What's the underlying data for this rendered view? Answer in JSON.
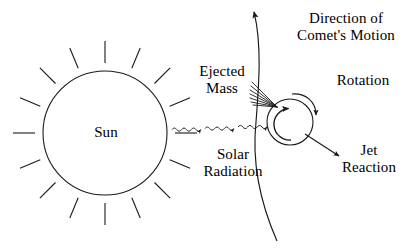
{
  "figure": {
    "background_color": "#ffffff",
    "stroke_color": "#1a1a1a",
    "text_color": "#000000",
    "width": 410,
    "height": 249
  },
  "labels": {
    "sun": "Sun",
    "ejected_mass": "Ejected\nMass",
    "solar_radiation": "Solar\nRadiation",
    "direction_of_motion": "Direction of\nComet's Motion",
    "rotation": "Rotation",
    "jet_reaction": "Jet\nReaction"
  },
  "diagram_data": {
    "type": "schematic-diagram",
    "sun": {
      "center_x": 105,
      "center_y": 133,
      "radius": 62,
      "ray_count": 16,
      "ray_inner_offset": 8,
      "ray_length": 22
    },
    "comet": {
      "center_x": 290,
      "center_y": 122,
      "radius": 23,
      "rotation_direction": "counter-clockwise-inner"
    },
    "orbit_path": {
      "description": "Comet's orbital arc passing through the nucleus, arrowhead at top pointing up-left",
      "arrow_tip_x": 252,
      "arrow_tip_y": 8
    },
    "solar_radiation_rays": {
      "count": 3,
      "y": 127,
      "x_start": 172,
      "x_end": 268,
      "style": "wavy-arrow"
    },
    "ejected_mass_spray": {
      "origin_x": 278,
      "origin_y": 106,
      "line_count": 7,
      "direction": "up-left"
    },
    "jet_reaction_arrow": {
      "from_x": 306,
      "from_y": 132,
      "to_x": 341,
      "to_y": 157
    },
    "rotation_arc_arrow": {
      "description": "Arc over the top-right of the comet, arrowhead pointing down at right side"
    }
  }
}
